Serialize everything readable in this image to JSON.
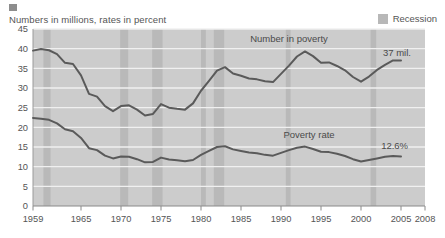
{
  "header": {
    "subtitle": "Numbers in millions, rates in percent",
    "marker_color": "#8d8d8d"
  },
  "legend": {
    "swatch_color": "#b8b8b8",
    "label": "Recession"
  },
  "annotations": {
    "number_series_label": "Number in poverty",
    "rate_series_label": "Poverty rate",
    "number_endpoint": "37 mil.",
    "rate_endpoint": "12.6%"
  },
  "colors": {
    "plot_background": "#cccccc",
    "recession_band": "#b9b9b9",
    "gridline": "#f0f0f0",
    "line": "#5a5a5a",
    "axis": "#8a8a8a",
    "text": "#555555"
  },
  "chart_data": {
    "type": "line",
    "title": "",
    "subtitle": "Numbers in millions, rates in percent",
    "xlabel": "",
    "ylabel": "",
    "xlim": [
      1959,
      2008
    ],
    "ylim": [
      0,
      45
    ],
    "yticks": [
      0,
      5,
      10,
      15,
      20,
      25,
      30,
      35,
      40,
      45
    ],
    "xticks": [
      1959,
      1965,
      1970,
      1975,
      1980,
      1985,
      1990,
      1995,
      2000,
      2005,
      2008
    ],
    "xtick_labels": [
      "1959",
      "1965",
      "1970",
      "1975",
      "1980",
      "1985",
      "1990",
      "1995",
      "2000",
      "2005",
      "2008"
    ],
    "ytick_labels": [
      "0",
      "5",
      "10",
      "15",
      "20",
      "25",
      "30",
      "35",
      "40",
      "45"
    ],
    "grid": true,
    "legend_position": "top-right",
    "legend_entries": [
      "Recession"
    ],
    "x": [
      1959,
      1960,
      1961,
      1962,
      1963,
      1964,
      1965,
      1966,
      1967,
      1968,
      1969,
      1970,
      1971,
      1972,
      1973,
      1974,
      1975,
      1976,
      1977,
      1978,
      1979,
      1980,
      1981,
      1982,
      1983,
      1984,
      1985,
      1986,
      1987,
      1988,
      1989,
      1990,
      1991,
      1992,
      1993,
      1994,
      1995,
      1996,
      1997,
      1998,
      1999,
      2000,
      2001,
      2002,
      2003,
      2004,
      2005
    ],
    "series": [
      {
        "name": "Number in poverty",
        "unit": "millions",
        "label_text": "Number in poverty",
        "endpoint_label": "37 mil.",
        "values": [
          39.5,
          39.9,
          39.6,
          38.6,
          36.4,
          36.1,
          33.2,
          28.5,
          27.8,
          25.4,
          24.1,
          25.4,
          25.6,
          24.5,
          23.0,
          23.4,
          25.9,
          25.0,
          24.7,
          24.5,
          26.1,
          29.3,
          31.8,
          34.4,
          35.3,
          33.7,
          33.1,
          32.4,
          32.2,
          31.7,
          31.5,
          33.6,
          35.7,
          38.0,
          39.3,
          38.1,
          36.4,
          36.5,
          35.6,
          34.5,
          32.8,
          31.6,
          32.9,
          34.6,
          35.9,
          37.0,
          37.0
        ]
      },
      {
        "name": "Poverty rate",
        "unit": "percent",
        "label_text": "Poverty rate",
        "endpoint_label": "12.6%",
        "values": [
          22.4,
          22.2,
          21.9,
          21.0,
          19.5,
          19.0,
          17.3,
          14.7,
          14.2,
          12.8,
          12.1,
          12.6,
          12.5,
          11.9,
          11.1,
          11.2,
          12.3,
          11.8,
          11.6,
          11.4,
          11.7,
          13.0,
          14.0,
          15.0,
          15.2,
          14.4,
          14.0,
          13.6,
          13.4,
          13.0,
          12.8,
          13.5,
          14.2,
          14.8,
          15.1,
          14.5,
          13.8,
          13.7,
          13.3,
          12.7,
          11.9,
          11.3,
          11.7,
          12.1,
          12.5,
          12.7,
          12.6
        ]
      }
    ],
    "recessions": [
      {
        "start": 1960.3,
        "end": 1961.2
      },
      {
        "start": 1969.9,
        "end": 1970.9
      },
      {
        "start": 1973.9,
        "end": 1975.2
      },
      {
        "start": 1980.0,
        "end": 1980.6
      },
      {
        "start": 1981.6,
        "end": 1982.9
      },
      {
        "start": 1990.6,
        "end": 1991.2
      },
      {
        "start": 2001.2,
        "end": 2001.9
      }
    ]
  }
}
